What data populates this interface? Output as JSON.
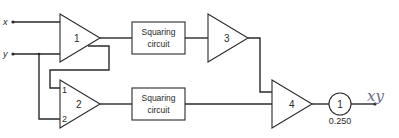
{
  "diagram": {
    "inputs": {
      "x": "x",
      "y": "y"
    },
    "amplifiers": [
      {
        "id": "1",
        "label": "1"
      },
      {
        "id": "2",
        "label": "2",
        "input_labels": [
          "1",
          "2"
        ]
      },
      {
        "id": "3",
        "label": "3"
      },
      {
        "id": "4",
        "label": "4"
      }
    ],
    "blocks": [
      {
        "line1": "Squaring",
        "line2": "circuit"
      },
      {
        "line1": "Squaring",
        "line2": "circuit"
      }
    ],
    "potentiometer": {
      "label": "1",
      "value": "0.250"
    },
    "output": "xy"
  }
}
